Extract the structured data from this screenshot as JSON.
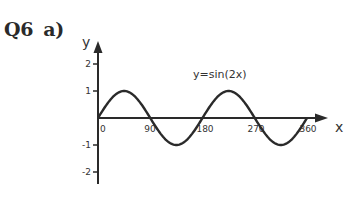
{
  "question": {
    "number": "Q6",
    "part": "a)"
  },
  "chart_data": {
    "type": "line",
    "title": "",
    "annotation": "y=sin(2x)",
    "xlabel": "x",
    "ylabel": "y",
    "x_ticks": [
      "0",
      "90",
      "180",
      "270",
      "360"
    ],
    "y_ticks": [
      "2",
      "1",
      "-1",
      "-2"
    ],
    "xlim": [
      0,
      360
    ],
    "ylim": [
      -2.4,
      2.7
    ],
    "grid": false,
    "legend": "none",
    "series": [
      {
        "name": "y=sin(2x)",
        "x": [
          0,
          45,
          90,
          135,
          180,
          225,
          270,
          315,
          360
        ],
        "values": [
          0,
          1,
          0,
          -1,
          0,
          1,
          0,
          -1,
          0
        ]
      }
    ]
  }
}
